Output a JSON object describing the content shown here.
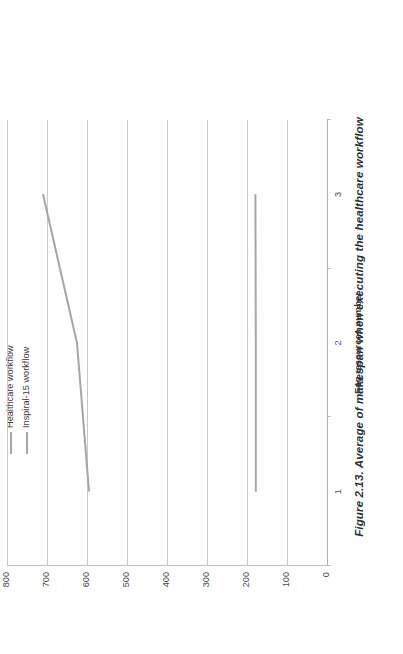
{
  "figure": {
    "caption": "Figure 2.13. Average of makespan when executing the healthcare workflow"
  },
  "chart_data": {
    "type": "line",
    "title": "",
    "subtitle": "",
    "xlabel": "Fog resources number",
    "ylabel": "",
    "categories": [
      "1",
      "2",
      "3"
    ],
    "x": [
      1,
      2,
      3
    ],
    "ylim": [
      0,
      800
    ],
    "yticks": [
      0,
      100,
      200,
      300,
      400,
      500,
      600,
      700,
      800
    ],
    "ytick_labels": [
      "0",
      "100",
      "200",
      "300",
      "400",
      "500",
      "600",
      "700",
      "800"
    ],
    "grid": true,
    "grid_axis": "y",
    "legend_position": "top-right",
    "orientation_note": "figure rotated 90 degrees counter-clockwise",
    "series": [
      {
        "name": "Healthcare workflow",
        "values": [
          595,
          625,
          710
        ],
        "color": "#a6a6a6"
      },
      {
        "name": "Inspiral-15 workflow",
        "values": [
          178,
          178,
          179
        ],
        "color": "#a6a6a6"
      }
    ]
  },
  "legend": {
    "items": [
      {
        "label": "Healthcare workflow",
        "color": "#a6a6a6"
      },
      {
        "label": "Inspiral-15 workflow",
        "color": "#a6a6a6"
      }
    ]
  },
  "colors": {
    "gridline": "#c9c9c9",
    "axis": "#b0b0b0",
    "series_line": "#a6a6a6",
    "text": "#3a3a3a",
    "background": "#ffffff"
  }
}
